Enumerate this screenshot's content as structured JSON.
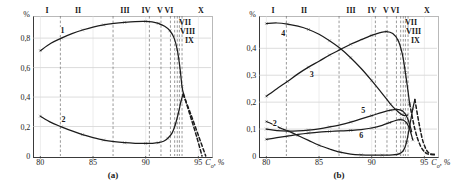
{
  "figure": {
    "panels": [
      {
        "caption": "(a)",
        "y_unit": "%",
        "x_axis_title": "C",
        "x_axis_title_sub": "о",
        "x_axis_title_tail": ", %",
        "y_ticks": [
          "0",
          "0,2",
          "0,4",
          "0,6",
          "0,8"
        ],
        "x_ticks": [
          "80",
          "85",
          "90",
          "95"
        ],
        "zone_labels_top": [
          "I",
          "II",
          "III",
          "IV",
          "V",
          "VI",
          "X"
        ],
        "zone_labels_inside": [
          "VII",
          "VIII",
          "IX"
        ],
        "curve_labels": [
          "1",
          "2"
        ]
      },
      {
        "caption": "(b)",
        "y_unit": "%",
        "x_axis_title": "C",
        "x_axis_title_sub": "о",
        "x_axis_title_tail": ", %",
        "y_ticks": [
          "0",
          "0,1",
          "0,2",
          "0,3",
          "0,4"
        ],
        "x_ticks": [
          "80",
          "85",
          "90",
          "95"
        ],
        "zone_labels_top": [
          "I",
          "II",
          "III",
          "IV",
          "V",
          "VI",
          "X"
        ],
        "zone_labels_inside": [
          "VII",
          "VIII",
          "IX"
        ],
        "curve_labels": [
          "2",
          "3",
          "4",
          "5",
          "6"
        ]
      }
    ]
  },
  "chart_data": [
    {
      "type": "line",
      "title": "(a)",
      "xlabel": "C_o, %",
      "ylabel": "%",
      "xlim": [
        79.3,
        96.2
      ],
      "ylim": [
        0,
        0.95
      ],
      "x_ticks": [
        80,
        85,
        90,
        95
      ],
      "y_ticks": [
        0,
        0.2,
        0.4,
        0.6,
        0.8
      ],
      "grid": "horizontal-gridlines-and-dashed-zone-boundaries",
      "zone_boundaries": [
        81.9,
        86.9,
        90.35,
        91.45,
        92.35,
        92.75,
        93.0,
        93.2,
        93.45
      ],
      "zone_labels": [
        "I",
        "II",
        "III",
        "IV",
        "V",
        "VI",
        "VII",
        "VIII",
        "IX",
        "X"
      ],
      "series": [
        {
          "name": "1",
          "style": "solid",
          "points": [
            [
              80,
              0.715
            ],
            [
              81,
              0.765
            ],
            [
              82,
              0.8
            ],
            [
              83,
              0.83
            ],
            [
              84,
              0.855
            ],
            [
              85,
              0.875
            ],
            [
              86,
              0.89
            ],
            [
              87,
              0.9
            ],
            [
              88,
              0.907
            ],
            [
              89,
              0.912
            ],
            [
              90,
              0.913
            ],
            [
              90.6,
              0.91
            ],
            [
              91.2,
              0.9
            ],
            [
              91.8,
              0.88
            ],
            [
              92.3,
              0.85
            ],
            [
              92.7,
              0.8
            ],
            [
              93.0,
              0.72
            ],
            [
              93.25,
              0.6
            ],
            [
              93.45,
              0.47
            ],
            [
              93.6,
              0.42
            ]
          ],
          "dashed_tail": [
            [
              93.6,
              0.42
            ],
            [
              94.2,
              0.28
            ],
            [
              94.8,
              0.14
            ],
            [
              95.35,
              0.0
            ]
          ]
        },
        {
          "name": "2",
          "style": "solid",
          "points": [
            [
              80,
              0.27
            ],
            [
              81,
              0.228
            ],
            [
              82,
              0.198
            ],
            [
              83,
              0.17
            ],
            [
              84,
              0.145
            ],
            [
              85,
              0.125
            ],
            [
              86,
              0.108
            ],
            [
              87,
              0.097
            ],
            [
              88,
              0.09
            ],
            [
              89,
              0.086
            ],
            [
              90,
              0.085
            ],
            [
              90.6,
              0.086
            ],
            [
              91.2,
              0.09
            ],
            [
              91.7,
              0.1
            ],
            [
              92.1,
              0.12
            ],
            [
              92.5,
              0.155
            ],
            [
              92.8,
              0.21
            ],
            [
              93.1,
              0.29
            ],
            [
              93.35,
              0.37
            ],
            [
              93.55,
              0.42
            ]
          ],
          "dashed_tail": [
            [
              93.55,
              0.42
            ],
            [
              94.3,
              0.28
            ],
            [
              95.0,
              0.14
            ],
            [
              95.7,
              0.0
            ]
          ]
        }
      ]
    },
    {
      "type": "line",
      "title": "(b)",
      "xlabel": "C_o, %",
      "ylabel": "%",
      "xlim": [
        79.3,
        96.2
      ],
      "ylim": [
        0,
        0.52
      ],
      "x_ticks": [
        80,
        85,
        90,
        95
      ],
      "y_ticks": [
        0,
        0.1,
        0.2,
        0.3,
        0.4
      ],
      "grid": "horizontal-gridlines-and-dashed-zone-boundaries",
      "zone_boundaries": [
        81.9,
        86.9,
        90.35,
        91.45,
        92.35,
        92.75,
        93.0,
        93.2,
        93.45
      ],
      "zone_labels": [
        "I",
        "II",
        "III",
        "IV",
        "V",
        "VI",
        "VII",
        "VIII",
        "IX",
        "X"
      ],
      "series": [
        {
          "name": "2",
          "style": "solid",
          "points": [
            [
              80,
              0.128
            ],
            [
              80.6,
              0.118
            ],
            [
              81.3,
              0.104
            ],
            [
              82,
              0.094
            ],
            [
              83,
              0.076
            ],
            [
              84,
              0.058
            ],
            [
              85,
              0.04
            ],
            [
              86,
              0.026
            ],
            [
              87,
              0.014
            ],
            [
              88,
              0.007
            ],
            [
              89,
              0.004
            ],
            [
              90,
              0.003
            ],
            [
              91,
              0.003
            ],
            [
              92,
              0.004
            ],
            [
              92.6,
              0.008
            ],
            [
              93,
              0.02
            ],
            [
              93.3,
              0.05
            ],
            [
              93.6,
              0.11
            ],
            [
              93.9,
              0.175
            ],
            [
              94.1,
              0.21
            ]
          ],
          "dashed_tail": [
            [
              94.1,
              0.21
            ],
            [
              94.5,
              0.12
            ],
            [
              94.9,
              0.05
            ],
            [
              95.4,
              0.012
            ],
            [
              96,
              0.006
            ]
          ]
        },
        {
          "name": "3",
          "style": "solid",
          "points": [
            [
              80,
              0.222
            ],
            [
              81,
              0.25
            ],
            [
              82,
              0.277
            ],
            [
              83,
              0.305
            ],
            [
              84,
              0.33
            ],
            [
              85,
              0.352
            ],
            [
              86,
              0.375
            ],
            [
              87,
              0.395
            ],
            [
              88,
              0.415
            ],
            [
              89,
              0.432
            ],
            [
              90,
              0.448
            ],
            [
              90.8,
              0.458
            ],
            [
              91.4,
              0.462
            ],
            [
              92,
              0.455
            ],
            [
              92.5,
              0.43
            ],
            [
              92.9,
              0.38
            ],
            [
              93.2,
              0.31
            ],
            [
              93.45,
              0.24
            ],
            [
              93.6,
              0.195
            ]
          ],
          "dashed_tail": [
            [
              93.6,
              0.195
            ],
            [
              94.1,
              0.1
            ],
            [
              94.6,
              0.04
            ],
            [
              95.2,
              0.01
            ],
            [
              96,
              0.004
            ]
          ]
        },
        {
          "name": "4",
          "style": "solid",
          "points": [
            [
              80,
              0.492
            ],
            [
              81,
              0.494
            ],
            [
              82,
              0.49
            ],
            [
              83,
              0.482
            ],
            [
              84,
              0.47
            ],
            [
              85,
              0.452
            ],
            [
              86,
              0.428
            ],
            [
              87,
              0.4
            ],
            [
              88,
              0.365
            ],
            [
              89,
              0.325
            ],
            [
              90,
              0.28
            ],
            [
              91,
              0.232
            ],
            [
              91.8,
              0.192
            ],
            [
              92.4,
              0.168
            ],
            [
              92.8,
              0.155
            ],
            [
              93.1,
              0.15
            ],
            [
              93.4,
              0.152
            ]
          ],
          "dashed_tail": []
        },
        {
          "name": "5",
          "style": "solid",
          "points": [
            [
              80,
              0.1
            ],
            [
              81,
              0.094
            ],
            [
              82,
              0.092
            ],
            [
              83,
              0.093
            ],
            [
              84,
              0.096
            ],
            [
              85,
              0.101
            ],
            [
              86,
              0.108
            ],
            [
              87,
              0.116
            ],
            [
              88,
              0.126
            ],
            [
              89,
              0.138
            ],
            [
              90,
              0.15
            ],
            [
              91,
              0.162
            ],
            [
              91.8,
              0.17
            ],
            [
              92.4,
              0.173
            ],
            [
              92.9,
              0.168
            ],
            [
              93.2,
              0.155
            ],
            [
              93.5,
              0.13
            ],
            [
              93.8,
              0.09
            ]
          ],
          "dashed_tail": []
        },
        {
          "name": "6",
          "style": "solid",
          "points": [
            [
              80,
              0.062
            ],
            [
              81,
              0.068
            ],
            [
              82,
              0.074
            ],
            [
              83,
              0.08
            ],
            [
              84,
              0.085
            ],
            [
              85,
              0.089
            ],
            [
              86,
              0.091
            ],
            [
              87,
              0.093
            ],
            [
              88,
              0.095
            ],
            [
              89,
              0.098
            ],
            [
              90,
              0.104
            ],
            [
              91,
              0.114
            ],
            [
              91.7,
              0.124
            ],
            [
              92.2,
              0.131
            ],
            [
              92.7,
              0.135
            ],
            [
              93,
              0.133
            ],
            [
              93.3,
              0.124
            ],
            [
              93.6,
              0.1
            ],
            [
              93.9,
              0.06
            ]
          ],
          "dashed_tail": []
        }
      ]
    }
  ]
}
